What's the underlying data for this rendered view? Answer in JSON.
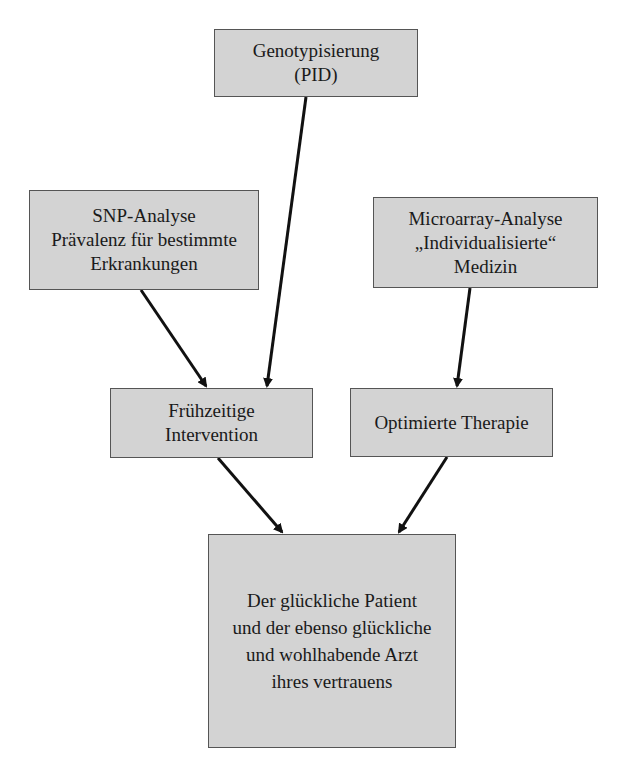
{
  "diagram": {
    "nodes": [
      {
        "id": "genotyping",
        "lines": [
          "Genotypisierung",
          "(PID)"
        ]
      },
      {
        "id": "snp",
        "lines": [
          "SNP-Analyse",
          "Prävalenz für bestimmte",
          "Erkrankungen"
        ]
      },
      {
        "id": "microarray",
        "lines": [
          "Microarray-Analyse",
          "„Individualisierte“",
          "Medizin"
        ]
      },
      {
        "id": "early",
        "lines": [
          "Frühzeitige",
          "Intervention"
        ]
      },
      {
        "id": "therapy",
        "lines": [
          "Optimierte Therapie"
        ]
      },
      {
        "id": "patient",
        "lines": [
          "Der glückliche Patient",
          "und der ebenso glückliche",
          "und wohlhabende Arzt",
          "ihres vertrauens"
        ]
      }
    ],
    "edges": [
      {
        "from": "genotyping",
        "to": "early"
      },
      {
        "from": "snp",
        "to": "early"
      },
      {
        "from": "microarray",
        "to": "therapy"
      },
      {
        "from": "early",
        "to": "patient"
      },
      {
        "from": "therapy",
        "to": "patient"
      }
    ]
  }
}
